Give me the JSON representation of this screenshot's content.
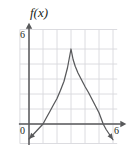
{
  "figure": {
    "labels": {
      "function_label": "f(x)",
      "y_axis_max": "6",
      "origin": "0",
      "x_axis_max": "6"
    },
    "colors": {
      "curve": "#58595b",
      "axis": "#58595b",
      "grid": "#d8d8dc",
      "text": "#231f20",
      "background": "#ffffff"
    }
  },
  "chart_data": {
    "type": "line",
    "title": "",
    "xlabel": "",
    "ylabel": "f(x)",
    "xlim": [
      -0.7,
      6.9
    ],
    "ylim": [
      -1.4,
      6.6
    ],
    "grid": true,
    "grid_spacing": 1,
    "legend": null,
    "xticks": [
      0,
      6
    ],
    "yticks": [
      0,
      6
    ],
    "xtick_labels": [
      "0",
      "6"
    ],
    "ytick_labels": [
      "0",
      "6"
    ],
    "axis_arrows": [
      "x-positive",
      "y-positive"
    ],
    "annotations": [
      {
        "text": "f(x)",
        "x": 0.15,
        "y": 6.6
      },
      {
        "text": "6",
        "x": -0.45,
        "y": 6.0
      },
      {
        "text": "0",
        "x": -0.45,
        "y": -0.45
      },
      {
        "text": "6",
        "x": 6.0,
        "y": -0.5
      }
    ],
    "series": [
      {
        "name": "f",
        "style": "solid",
        "endpoint_markers": [
          "arrow-start",
          "arrow-end"
        ],
        "peak": {
          "x": 3,
          "y": 5,
          "type": "cusp"
        },
        "x_intercepts": [
          1.0,
          5.3
        ],
        "points": [
          [
            0.0,
            -1.0
          ],
          [
            0.25,
            -0.75
          ],
          [
            0.5,
            -0.5
          ],
          [
            0.75,
            -0.25
          ],
          [
            1.0,
            0.0
          ],
          [
            1.25,
            0.43
          ],
          [
            1.5,
            0.85
          ],
          [
            1.75,
            1.28
          ],
          [
            2.0,
            1.7
          ],
          [
            2.25,
            2.25
          ],
          [
            2.5,
            2.85
          ],
          [
            2.75,
            3.75
          ],
          [
            3.0,
            5.0
          ],
          [
            3.15,
            4.3
          ],
          [
            3.3,
            3.85
          ],
          [
            3.5,
            3.4
          ],
          [
            3.75,
            2.95
          ],
          [
            4.0,
            2.5
          ],
          [
            4.25,
            2.1
          ],
          [
            4.5,
            1.65
          ],
          [
            4.75,
            1.2
          ],
          [
            5.0,
            0.75
          ],
          [
            5.3,
            0.0
          ],
          [
            5.5,
            -0.35
          ],
          [
            5.75,
            -0.7
          ],
          [
            6.0,
            -1.05
          ]
        ]
      }
    ]
  }
}
